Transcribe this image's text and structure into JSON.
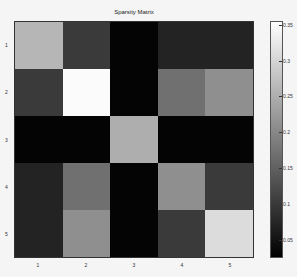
{
  "chart_data": {
    "type": "heatmap",
    "title": "Sparsity Matrix",
    "xlabel": "",
    "ylabel": "",
    "x_ticks": [
      "1",
      "2",
      "3",
      "4",
      "5"
    ],
    "y_ticks": [
      "1",
      "2",
      "3",
      "4",
      "5"
    ],
    "colormap": "gray",
    "colorbar": {
      "ticks": [
        "0.35",
        "0.3",
        "0.25",
        "0.2",
        "0.15",
        "0.1",
        "0.05"
      ],
      "range": [
        0.025,
        0.355
      ]
    },
    "values": [
      [
        0.26,
        0.1,
        0.03,
        0.07,
        0.07
      ],
      [
        0.1,
        0.35,
        0.03,
        0.17,
        0.21
      ],
      [
        0.03,
        0.03,
        0.25,
        0.03,
        0.03
      ],
      [
        0.07,
        0.17,
        0.03,
        0.21,
        0.1
      ],
      [
        0.07,
        0.21,
        0.03,
        0.1,
        0.31
      ]
    ],
    "grid": false,
    "legend_position": "right colorbar"
  }
}
